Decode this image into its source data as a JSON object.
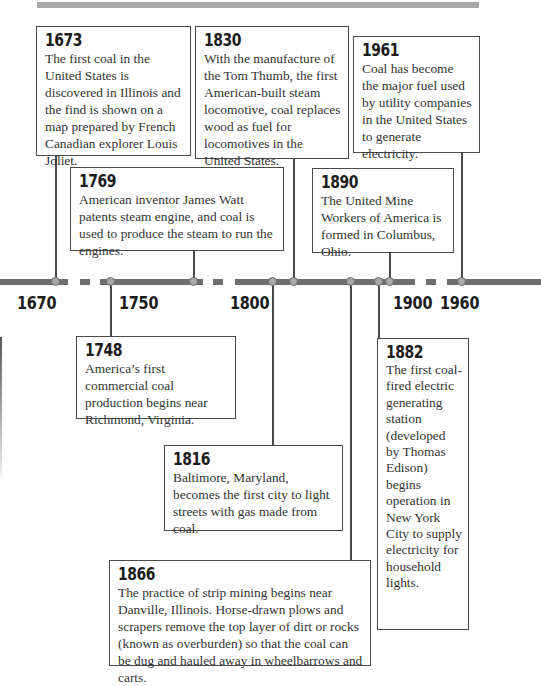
{
  "decor": {
    "top_bar_color": "#a9a9a9",
    "line_color": "#6e6e6e",
    "node_color": "#a8a8a8"
  },
  "axis_labels": [
    {
      "label": "1670",
      "x": 17
    },
    {
      "label": "1750",
      "x": 119
    },
    {
      "label": "1800",
      "x": 230
    },
    {
      "label": "1900",
      "x": 393
    },
    {
      "label": "1960",
      "x": 440
    }
  ],
  "events": [
    {
      "year": "1673",
      "text": "The first coal in the United States is discovered in Illinois and the find is shown on a map prepared by French Canadian explorer Louis Joliet."
    },
    {
      "year": "1830",
      "text": "With the manufacture of the Tom Thumb, the first American-built steam locomotive, coal replaces wood as fuel for locomotives in the United States."
    },
    {
      "year": "1961",
      "text": "Coal has become the major fuel used by utility companies in the United States to generate electricity."
    },
    {
      "year": "1769",
      "text": "American inventor James Watt patents steam engine, and coal is used to produce the steam to run the engines."
    },
    {
      "year": "1890",
      "text": "The United Mine Workers of America is formed in Columbus, Ohio."
    },
    {
      "year": "1748",
      "text": "America’s first commercial coal production begins near Richmond, Virginia."
    },
    {
      "year": "1816",
      "text": "Baltimore, Maryland, becomes the first city to light streets with gas made from coal."
    },
    {
      "year": "1866",
      "text": "The practice of strip mining begins near Danville, Illinois. Horse-drawn plows and scrapers remove the top layer of dirt or rocks (known as overburden) so that the coal can be dug and hauled away in wheelbarrows and carts."
    },
    {
      "year": "1882",
      "text": "The first coal-fired electric generating station (developed by Thomas Edison) begins operation in New York City to supply electricity for household lights."
    }
  ]
}
